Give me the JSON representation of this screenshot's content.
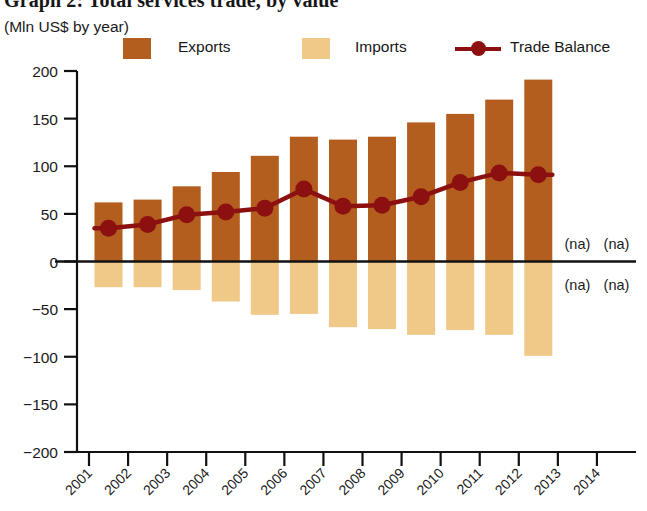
{
  "header": {
    "title": "Graph 2: Total services trade, by value",
    "subtitle": "(Mln US$ by year)"
  },
  "legend": {
    "items": [
      {
        "label": "Exports",
        "type": "swatch",
        "color": "#b35e1f"
      },
      {
        "label": "Imports",
        "type": "swatch",
        "color": "#f0c887"
      },
      {
        "label": "Trade Balance",
        "type": "line-marker",
        "color": "#8c1010"
      }
    ]
  },
  "colors": {
    "exports": "#b35e1f",
    "imports": "#f0c887",
    "trade_balance": "#8c1010",
    "axis": "#111111",
    "text": "#1a1a1a",
    "background": "#ffffff"
  },
  "na_labels": [
    {
      "text": "(na)",
      "year": "2013",
      "side": "above"
    },
    {
      "text": "(na)",
      "year": "2014",
      "side": "above"
    },
    {
      "text": "(na)",
      "year": "2013",
      "side": "below"
    },
    {
      "text": "(na)",
      "year": "2014",
      "side": "below"
    }
  ],
  "chart_data": {
    "type": "bar",
    "title": "Graph 2: Total services trade, by value",
    "subtitle": "(Mln US$ by year)",
    "xlabel": "",
    "ylabel": "(Mln US$ by year)",
    "ylim": [
      -200,
      200
    ],
    "yticks": [
      200,
      150,
      100,
      50,
      0,
      -50,
      -100,
      -150,
      -200
    ],
    "ytick_labels": [
      "200",
      "150",
      "100",
      "50",
      "0",
      "-50",
      "-100",
      "-150",
      "-200"
    ],
    "grid": false,
    "legend_position": "top",
    "categories": [
      "2001",
      "2002",
      "2003",
      "2004",
      "2005",
      "2006",
      "2007",
      "2008",
      "2009",
      "2010",
      "2011",
      "2012",
      "2013",
      "2014"
    ],
    "series": [
      {
        "name": "Exports",
        "type": "bar",
        "color": "#b35e1f",
        "values": [
          62,
          65,
          79,
          94,
          111,
          131,
          128,
          131,
          146,
          155,
          170,
          191,
          null,
          null
        ]
      },
      {
        "name": "Imports",
        "type": "bar",
        "color": "#f0c887",
        "values": [
          -27,
          -27,
          -30,
          -42,
          -56,
          -55,
          -69,
          -71,
          -77,
          -72,
          -77,
          -99,
          null,
          null
        ]
      },
      {
        "name": "Trade Balance",
        "type": "line",
        "color": "#8c1010",
        "values": [
          35,
          39,
          49,
          52,
          56,
          76,
          58,
          59,
          68,
          83,
          93,
          91,
          null,
          null
        ]
      }
    ]
  }
}
